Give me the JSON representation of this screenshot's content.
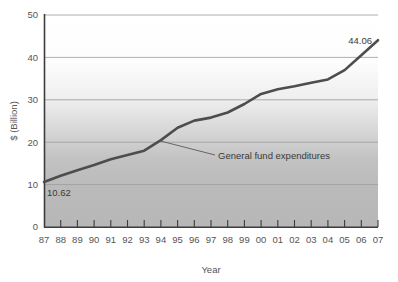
{
  "chart_data": {
    "type": "line",
    "title": "",
    "xlabel": "Year",
    "ylabel": "$ (Billion)",
    "xlim": [
      1987,
      2007
    ],
    "ylim": [
      0,
      50
    ],
    "yticks": [
      0,
      10,
      20,
      30,
      40,
      50
    ],
    "ytick_labels": [
      "0",
      "10",
      "20",
      "30",
      "40",
      "50"
    ],
    "grid": true,
    "legend": "none",
    "categories": [
      "87",
      "88",
      "89",
      "90",
      "91",
      "92",
      "93",
      "94",
      "95",
      "96",
      "97",
      "98",
      "99",
      "00",
      "01",
      "02",
      "03",
      "04",
      "05",
      "06",
      "07"
    ],
    "series": [
      {
        "name": "General fund expenditures",
        "color": "#4d4d4d",
        "values": [
          10.62,
          12.1,
          13.4,
          14.6,
          16.0,
          17.0,
          18.0,
          20.5,
          23.4,
          25.1,
          25.8,
          27.0,
          29.0,
          31.4,
          32.5,
          33.2,
          34.0,
          34.8,
          37.0,
          40.5,
          44.06
        ]
      }
    ],
    "point_labels": [
      {
        "text": "10.62",
        "category": "87",
        "value": 10.62,
        "position": "below-right"
      },
      {
        "text": "44.06",
        "category": "07",
        "value": 44.06,
        "position": "above-left"
      }
    ],
    "annotations": [
      {
        "text": "General fund expenditures",
        "anchor_category": "94",
        "anchor_value": 20.5,
        "leader": true
      }
    ],
    "style": {
      "plot_background_top": "#ffffff",
      "plot_background_bottom": "#b9b9b9",
      "gridline_color": "#9a9a9a",
      "axis_color": "#3c3c3c",
      "line_color": "#4d4d4d",
      "line_width": 2.6
    }
  }
}
